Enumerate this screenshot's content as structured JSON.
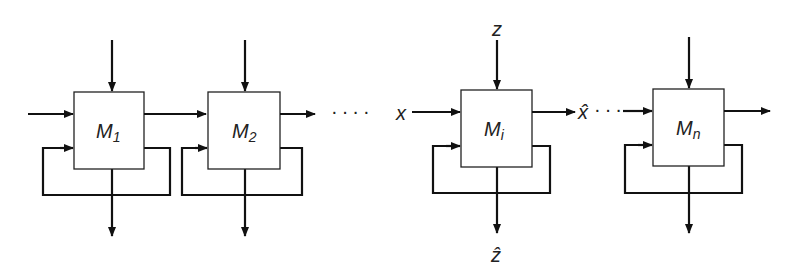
{
  "diagram": {
    "type": "chain of modules with feedback loops",
    "modules": [
      {
        "id": "M1",
        "label": "M",
        "subscript": "1"
      },
      {
        "id": "M2",
        "label": "M",
        "subscript": "2"
      },
      {
        "id": "Mi",
        "label": "M",
        "subscript": "i"
      },
      {
        "id": "Mn",
        "label": "M",
        "subscript": "n"
      }
    ],
    "signals": {
      "input_x": "x",
      "input_z": "z",
      "output_x_hat": "x̂",
      "output_z_hat": "ẑ"
    },
    "ellipsis": "····",
    "ellipsis_short": "···"
  }
}
